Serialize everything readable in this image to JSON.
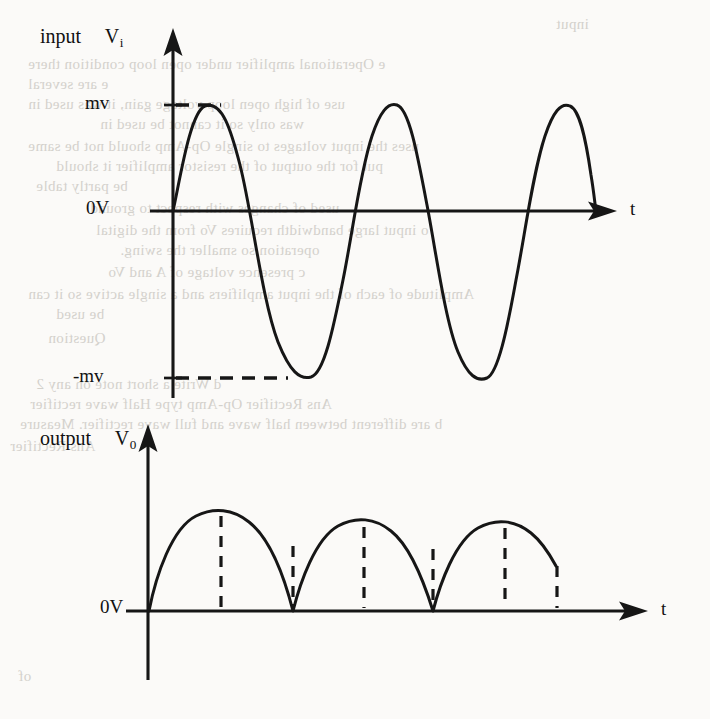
{
  "figure": {
    "kind": "waveform-diagram",
    "ink_color": "#161616",
    "paper_color": "#fbfaf8",
    "bleed_color": "#c9c6c0"
  },
  "input_chart": {
    "label_prefix": "input",
    "symbol_main": "V",
    "symbol_sub": "i",
    "axis_x_label": "t",
    "y_ticks": [
      {
        "label": "mv",
        "value": 1
      },
      {
        "label": "0V",
        "value": 0
      },
      {
        "label": "-mv",
        "value": -1
      }
    ],
    "guides": [
      {
        "name": "peak-guide",
        "label": "mv",
        "style": "dashed-horizontal"
      },
      {
        "name": "trough-guide",
        "label": "-mv",
        "style": "dashed-horizontal"
      }
    ]
  },
  "output_chart": {
    "label_prefix": "output",
    "symbol_main": "V",
    "symbol_sub": "0",
    "axis_x_label": "t",
    "y_ticks": [
      {
        "label": "0V",
        "value": 0
      }
    ]
  },
  "chart_data": [
    {
      "type": "line",
      "name": "input-waveform",
      "title": "input Vi",
      "xlabel": "t",
      "ylabel": "Vi",
      "ytick_labels": [
        "mv",
        "0V",
        "-mv"
      ],
      "ytick_values": [
        1,
        0,
        -1
      ],
      "ylim": [
        -1.25,
        1.35
      ],
      "xlim": [
        0,
        2.75
      ],
      "grid": false,
      "legend": false,
      "waveform": "sine",
      "cycles": 2.75,
      "amplitude": 1,
      "x": [
        0,
        0.125,
        0.25,
        0.375,
        0.5,
        0.625,
        0.75,
        0.875,
        1.0,
        1.125,
        1.25,
        1.375,
        1.5,
        1.625,
        1.75,
        1.875,
        2.0,
        2.125,
        2.25,
        2.375,
        2.5,
        2.625,
        2.75
      ],
      "values": [
        0,
        0.707,
        1,
        0.707,
        0,
        -0.707,
        -1,
        -0.707,
        0,
        0.707,
        1,
        0.707,
        0,
        -0.707,
        -1,
        -0.707,
        0,
        0.707,
        1,
        0.707,
        0,
        -0.707,
        -1
      ],
      "annotations": [
        {
          "text": "mv",
          "type": "dashed-level",
          "y": 1
        },
        {
          "text": "-mv",
          "type": "dashed-level",
          "y": -1
        }
      ]
    },
    {
      "type": "line",
      "name": "output-waveform",
      "title": "output V0",
      "xlabel": "t",
      "ylabel": "V0",
      "ytick_labels": [
        "0V"
      ],
      "ytick_values": [
        0
      ],
      "ylim": [
        0,
        1.25
      ],
      "xlim": [
        0,
        3.5
      ],
      "grid": false,
      "legend": false,
      "waveform": "full-wave-rectified-sine",
      "humps": 3.5,
      "amplitude": 1,
      "x": [
        0,
        0.25,
        0.5,
        0.75,
        1.0,
        1.25,
        1.5,
        1.75,
        2.0,
        2.25,
        2.5,
        2.75,
        3.0,
        3.25,
        3.5
      ],
      "values": [
        0,
        0.707,
        1,
        0.707,
        0,
        0.707,
        1,
        0.707,
        0,
        0.707,
        1,
        0.707,
        0,
        0.707,
        1
      ],
      "annotations": [
        {
          "text": "",
          "type": "dashed-vertical",
          "x": 0.5
        },
        {
          "text": "",
          "type": "dashed-vertical",
          "x": 1.0
        },
        {
          "text": "",
          "type": "dashed-vertical",
          "x": 1.5
        },
        {
          "text": "",
          "type": "dashed-vertical",
          "x": 2.0
        },
        {
          "text": "",
          "type": "dashed-vertical",
          "x": 2.5
        },
        {
          "text": "",
          "type": "dashed-vertical",
          "x": 3.0
        },
        {
          "text": "",
          "type": "dashed-vertical",
          "x": 3.5
        }
      ]
    }
  ],
  "background_text": {
    "lines": [
      {
        "text": "input",
        "x": 556,
        "y": 16,
        "size": 15,
        "mirror": true
      },
      {
        "text": "e  Operational amplifier under open loop condition  there",
        "x": 28,
        "y": 56,
        "size": 15,
        "mirror": true
      },
      {
        "text": "e are several",
        "x": 28,
        "y": 76,
        "size": 15,
        "mirror": true
      },
      {
        "text": "use of high open  loop voltage gain, it was used in",
        "x": 28,
        "y": 96,
        "size": 15,
        "mirror": true
      },
      {
        "text": "was only  so it cannot be used in",
        "x": 100,
        "y": 116,
        "size": 15,
        "mirror": true
      },
      {
        "text": "uses the  input voltages to single  Op-Amp should not be same",
        "x": 28,
        "y": 138,
        "size": 15,
        "mirror": true
      },
      {
        "text": "put for  the output of the  resistor  amplifier  it should",
        "x": 56,
        "y": 158,
        "size": 15,
        "mirror": true
      },
      {
        "text": "be partly table",
        "x": 36,
        "y": 178,
        "size": 15,
        "mirror": true
      },
      {
        "text": "used of changes with  respect to ground",
        "x": 90,
        "y": 200,
        "size": 15,
        "mirror": true
      },
      {
        "text": "o   input  large bandwidth  requires  Vo   from   the   digital",
        "x": 96,
        "y": 222,
        "size": 15,
        "mirror": true
      },
      {
        "text": "operation so smaller the swing.",
        "x": 120,
        "y": 242,
        "size": 15,
        "mirror": true
      },
      {
        "text": "c   presence voltage of A  and  Vo",
        "x": 108,
        "y": 264,
        "size": 15,
        "mirror": true
      },
      {
        "text": "Amplitude of each of the input  amplifiers and a single  active  so it can",
        "x": 28,
        "y": 286,
        "size": 15,
        "mirror": true
      },
      {
        "text": "be used",
        "x": 56,
        "y": 306,
        "size": 15,
        "mirror": true
      },
      {
        "text": "Question",
        "x": 48,
        "y": 330,
        "size": 15,
        "mirror": true
      },
      {
        "text": "d   Write a  short  note on any 2",
        "x": 36,
        "y": 376,
        "size": 15,
        "mirror": true
      },
      {
        "text": "Ans  Rectifier  Op-Amp  type  Half  wave rectifier",
        "x": 30,
        "y": 396,
        "size": 15,
        "mirror": true
      },
      {
        "text": "b  are  different  between  half  wave and  full  wave rectifier.  Measure",
        "x": 20,
        "y": 416,
        "size": 15,
        "mirror": true
      },
      {
        "text": "Ans  Rectifier",
        "x": 10,
        "y": 438,
        "size": 15,
        "mirror": true
      },
      {
        "text": "of",
        "x": 18,
        "y": 668,
        "size": 15,
        "mirror": true
      }
    ]
  }
}
